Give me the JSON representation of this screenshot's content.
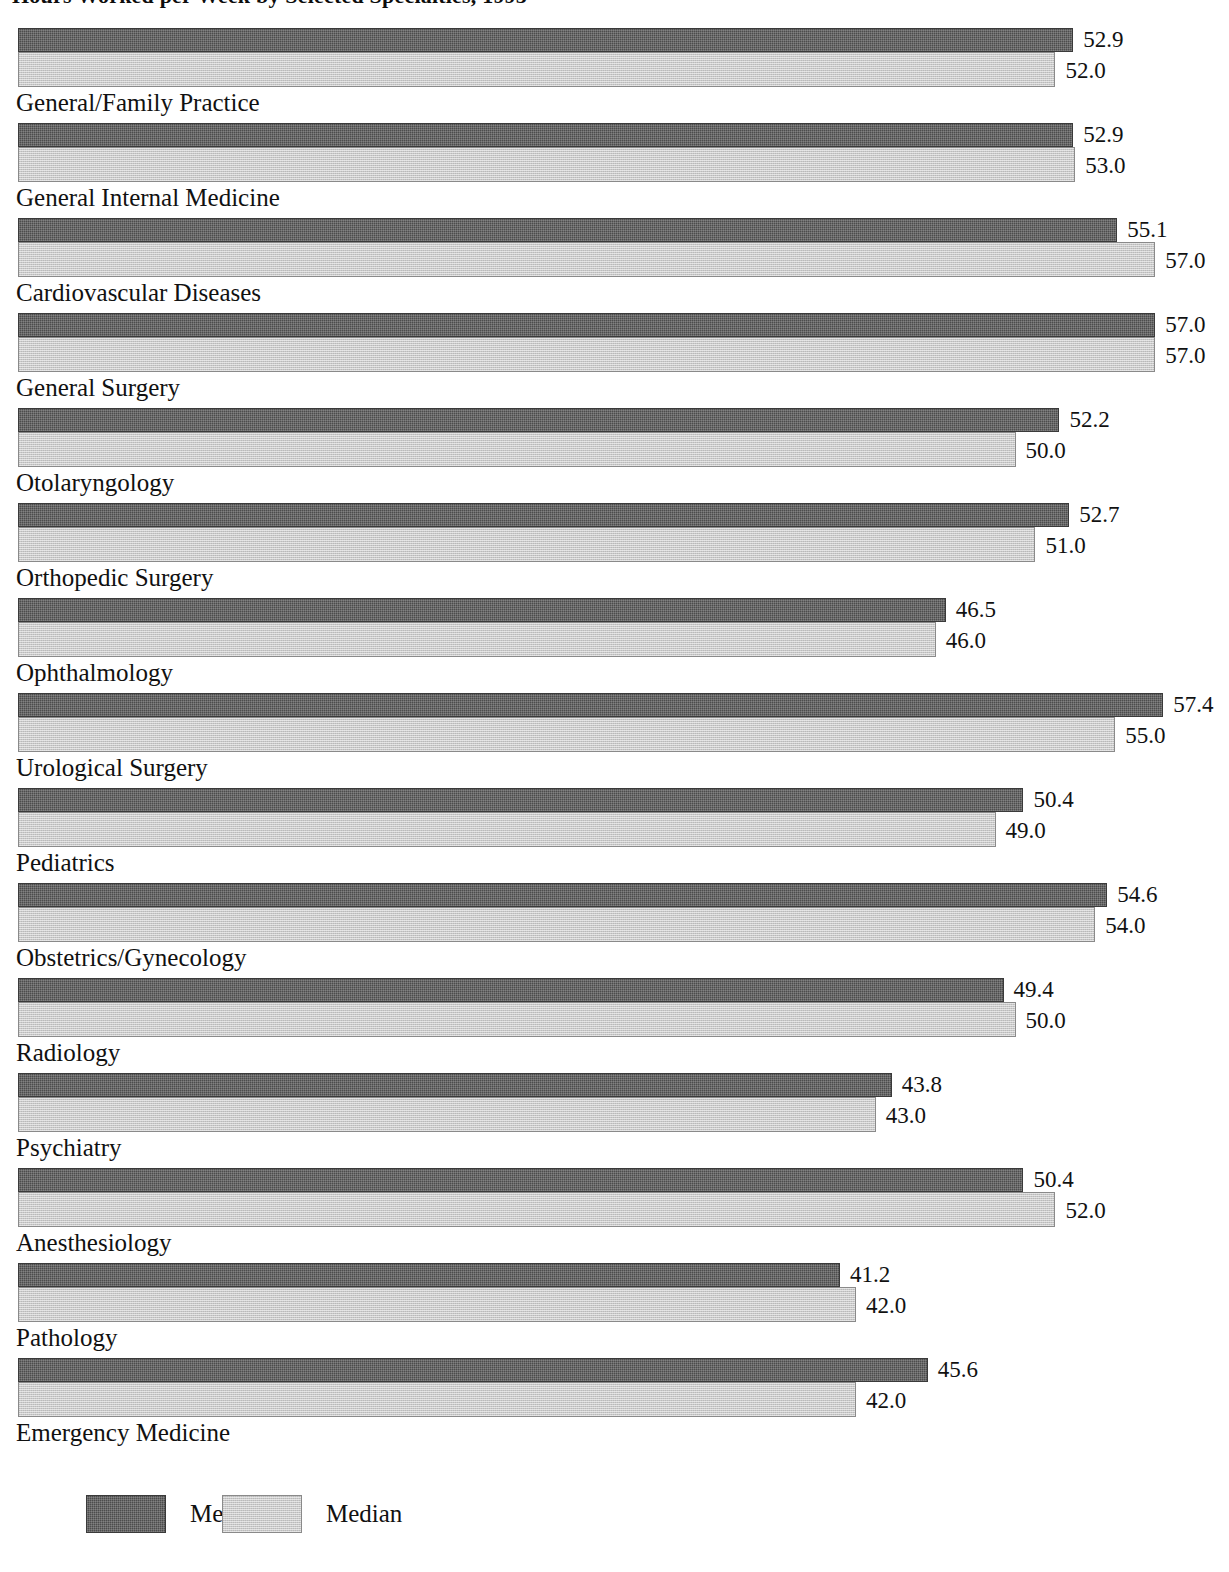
{
  "chart_data": {
    "type": "bar",
    "title": "Hours Worked per Week by Selected Specialties, 1995",
    "orientation": "horizontal",
    "grid": false,
    "xlabel": "",
    "ylabel": "",
    "xlim": [
      0,
      60
    ],
    "legend_position": "bottom-left",
    "categories": [
      "General/Family Practice",
      "General Internal Medicine",
      "Cardiovascular Diseases",
      "General Surgery",
      "Otolaryngology",
      "Orthopedic Surgery",
      "Ophthalmology",
      "Urological Surgery",
      "Pediatrics",
      "Obstetrics/Gynecology",
      "Radiology",
      "Psychiatry",
      "Anesthesiology",
      "Pathology",
      "Emergency Medicine"
    ],
    "series": [
      {
        "name": "Mean",
        "color": "#4c4c4c",
        "values": [
          52.9,
          52.9,
          55.1,
          57.0,
          52.2,
          52.7,
          46.5,
          57.4,
          50.4,
          54.6,
          49.4,
          43.8,
          50.4,
          41.2,
          45.6
        ],
        "labels": [
          "52.9",
          "52.9",
          "55.1",
          "57.0",
          "52.2",
          "52.7",
          "46.5",
          "57.4",
          "50.4",
          "54.6",
          "49.4",
          "43.8",
          "50.4",
          "41.2",
          "45.6"
        ]
      },
      {
        "name": "Median",
        "color": "#c9c9c9",
        "values": [
          52.0,
          53.0,
          57.0,
          57.0,
          50.0,
          51.0,
          46.0,
          55.0,
          49.0,
          54.0,
          50.0,
          43.0,
          52.0,
          42.0,
          42.0
        ],
        "labels": [
          "52.0",
          "53.0",
          "57.0",
          "57.0",
          "50.0",
          "51.0",
          "46.0",
          "55.0",
          "49.0",
          "54.0",
          "50.0",
          "43.0",
          "52.0",
          "42.0",
          "42.0"
        ]
      }
    ]
  },
  "legend": {
    "mean_label": "Mean",
    "median_label": "Median"
  }
}
